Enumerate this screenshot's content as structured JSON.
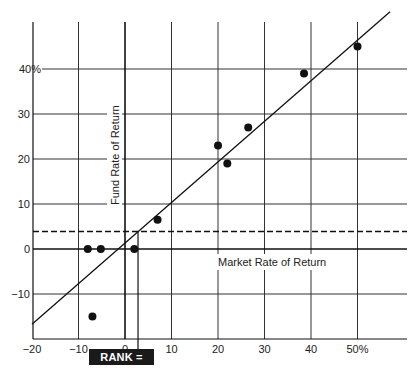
{
  "chart_data": {
    "type": "scatter",
    "title": "",
    "xlabel": "Market Rate of Return",
    "ylabel": "Fund Rate of Return",
    "xlim": [
      -20,
      57
    ],
    "ylim": [
      -20,
      52
    ],
    "grid": true,
    "x_ticks": [
      -20,
      -10,
      0,
      10,
      20,
      30,
      40,
      50
    ],
    "x_tick_labels": [
      "−20",
      "−10",
      "0",
      "10",
      "20",
      "30",
      "40",
      "50%"
    ],
    "y_ticks": [
      -10,
      0,
      10,
      20,
      30,
      40
    ],
    "y_tick_labels": [
      "−10",
      "0",
      "10",
      "20",
      "30",
      "40%"
    ],
    "points": [
      {
        "x": -8,
        "y": 0
      },
      {
        "x": -5.2,
        "y": 0
      },
      {
        "x": 2,
        "y": 0
      },
      {
        "x": -7,
        "y": -15
      },
      {
        "x": 7,
        "y": 6.5
      },
      {
        "x": 20,
        "y": 23
      },
      {
        "x": 22,
        "y": 19
      },
      {
        "x": 26.5,
        "y": 27
      },
      {
        "x": 38.5,
        "y": 39
      },
      {
        "x": 50,
        "y": 45
      }
    ],
    "regression_line": {
      "slope": 0.9,
      "x_intercept": -1.5,
      "from": [
        -20,
        -16.7
      ],
      "to": [
        57,
        52.7
      ]
    },
    "reference_line": {
      "style": "dashed",
      "y": 3.9,
      "label": "risk-free rate"
    },
    "intersection_marker_x": 2.8,
    "annotation": "RANK = 3.02"
  },
  "labels": {
    "x_axis": "Market Rate of Return",
    "y_axis": "Fund Rate of Return",
    "rank": "RANK = 3.02"
  }
}
